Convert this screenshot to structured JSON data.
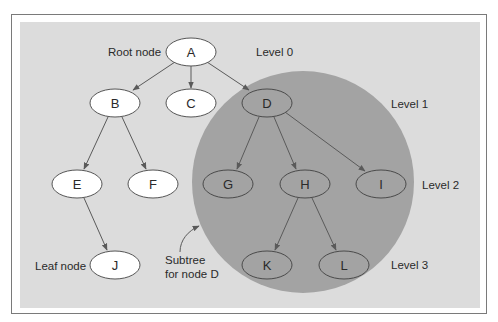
{
  "figure": {
    "annotations": {
      "root_label": "Root node",
      "leaf_label": "Leaf node",
      "subtree_line1": "Subtree",
      "subtree_line2": "for node D"
    },
    "levels": [
      {
        "label": "Level 0"
      },
      {
        "label": "Level 1"
      },
      {
        "label": "Level 2"
      },
      {
        "label": "Level 3"
      }
    ],
    "nodes": {
      "A": "A",
      "B": "B",
      "C": "C",
      "D": "D",
      "E": "E",
      "F": "F",
      "G": "G",
      "H": "H",
      "I": "I",
      "J": "J",
      "K": "K",
      "L": "L"
    },
    "edges": [
      [
        "A",
        "B"
      ],
      [
        "A",
        "C"
      ],
      [
        "A",
        "D"
      ],
      [
        "B",
        "E"
      ],
      [
        "B",
        "F"
      ],
      [
        "D",
        "G"
      ],
      [
        "D",
        "H"
      ],
      [
        "D",
        "I"
      ],
      [
        "E",
        "J"
      ],
      [
        "H",
        "K"
      ],
      [
        "H",
        "L"
      ]
    ],
    "highlighted_subtree_root": "D",
    "colors": {
      "panel_bg": "#dcdcdc",
      "subtree_fill": "#a3a3a3",
      "plain_node_fill": "#ffffff",
      "subtree_node_fill": "#a3a3a3",
      "stroke": "#555555"
    }
  }
}
